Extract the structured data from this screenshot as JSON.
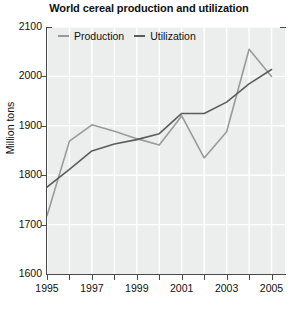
{
  "chart_data": {
    "type": "line",
    "title": "World cereal production and utilization",
    "xlabel": "",
    "ylabel": "Million tons",
    "xlim": [
      1995,
      2005.6
    ],
    "ylim": [
      1600,
      2100
    ],
    "ytick_values": [
      2100,
      2000,
      1900,
      1800,
      1700,
      1600
    ],
    "ytick_labels": [
      "2100",
      "2000",
      "1900",
      "1800",
      "1700",
      "1600"
    ],
    "xtick_values": [
      1995,
      1997,
      1999,
      2001,
      2003,
      2005
    ],
    "xtick_labels": [
      "1995",
      "1997",
      "1999",
      "2001",
      "2003",
      "2005"
    ],
    "xtick_minor": [
      1996,
      1998,
      2000,
      2002,
      2004
    ],
    "grid": true,
    "grid_color": "#ffffff",
    "plot_bgcolor": "#eceded",
    "legend_position": "top-left",
    "x": [
      1995,
      1996,
      1997,
      1998,
      1999,
      2000,
      2001,
      2002,
      2003,
      2004,
      2005
    ],
    "series": [
      {
        "name": "Production",
        "color": "#9a9a9a",
        "values": [
          1718,
          1869,
          1902,
          1889,
          1874,
          1861,
          1920,
          1835,
          1888,
          2055,
          2000
        ]
      },
      {
        "name": "Utilization",
        "color": "#5c5c5c",
        "values": [
          1776,
          1812,
          1849,
          1863,
          1872,
          1884,
          1925,
          1925,
          1948,
          1985,
          2014
        ]
      }
    ]
  },
  "legend": {
    "items": [
      {
        "label": "Production"
      },
      {
        "label": "Utilization"
      }
    ]
  }
}
